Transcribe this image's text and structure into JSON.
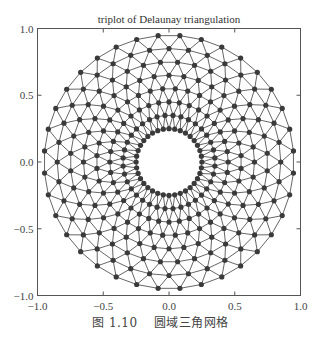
{
  "chart_data": {
    "type": "triplot",
    "title": "triplot of Delaunay triangulation",
    "xlabel": "",
    "ylabel": "",
    "xlim": [
      -1.0,
      1.0
    ],
    "ylim": [
      -1.0,
      1.0
    ],
    "xticks": [
      "-1.0",
      "-0.5",
      "0.0",
      "0.5",
      "1.0"
    ],
    "yticks": [
      "-1.0",
      "-0.5",
      "0.0",
      "0.5",
      "1.0"
    ],
    "grid": false,
    "legend": null,
    "mesh": {
      "shape": "annulus",
      "n_angles": 36,
      "n_radii": 8,
      "min_radius": 0.25,
      "max_radius": 0.95,
      "alternate_ring_rotation": true,
      "triangulation": "delaunay",
      "line_color": "#555555",
      "marker": "o",
      "marker_color": "#3a3a3a"
    }
  },
  "caption": {
    "number": "图 1.10",
    "text": "圆域三角网格"
  },
  "colors": {
    "axes": "#555555",
    "text": "#333333",
    "background": "#ffffff"
  }
}
